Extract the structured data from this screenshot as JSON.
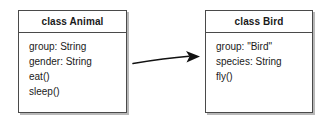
{
  "diagram": {
    "type": "uml-class-diagram",
    "background_color": "#ffffff",
    "border_color": "#4a4a4a",
    "shadow_color": "#b8b8b8",
    "text_color": "#1a1a1a",
    "classes": [
      {
        "id": "animal",
        "header": "class Animal",
        "members": [
          "group: String",
          "gender: String",
          "eat()",
          "sleep()"
        ]
      },
      {
        "id": "bird",
        "header": "class Bird",
        "members": [
          "group: \"Bird\"",
          "species: String",
          "fly()"
        ]
      }
    ],
    "connector": {
      "name": "inheritance-arrow",
      "from": "animal",
      "to": "bird",
      "style": "curved-solid-line",
      "arrowhead": "solid-filled-triangle",
      "color": "#111111"
    }
  }
}
